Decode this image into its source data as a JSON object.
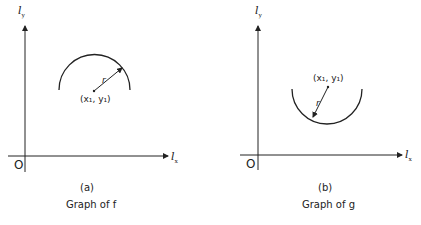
{
  "panels": [
    {
      "id": "a",
      "y_axis_label": "l",
      "y_axis_sub": "y",
      "x_axis_label": "l",
      "x_axis_sub": "x",
      "origin": "O",
      "center_label": "(x₁, y₁)",
      "radius_label": "r",
      "caption_letter": "(a)",
      "caption": "Graph of f",
      "arc": "upper semicircle"
    },
    {
      "id": "b",
      "y_axis_label": "l",
      "y_axis_sub": "y",
      "x_axis_label": "l",
      "x_axis_sub": "x",
      "origin": "O",
      "center_label": "(x₁, y₁)",
      "radius_label": "r",
      "caption_letter": "(b)",
      "caption": "Graph of g",
      "arc": "lower semicircle"
    }
  ],
  "colors": {
    "ink": "#222222",
    "background": "#ffffff"
  }
}
